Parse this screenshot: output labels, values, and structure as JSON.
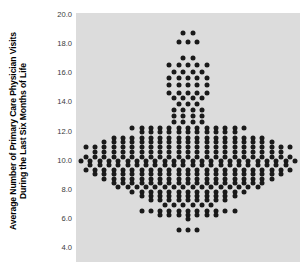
{
  "chart_data": {
    "type": "scatter",
    "plot_style": "dot-plot",
    "title": "",
    "xlabel": "",
    "ylabel": "Average Number of Primary Care Physician Visits During the Last Six Months of Life",
    "ylabel_line1": "Average Number of Primary Care Physician Visits",
    "ylabel_line2": "During the Last Six Months of Life",
    "ylim": [
      4.0,
      20.0
    ],
    "ytick_labels": [
      "20.0",
      "18.0",
      "16.0",
      "14.0",
      "12.0",
      "10.0",
      "8.0",
      "6.0",
      "4.0"
    ],
    "ytick_values": [
      20.0,
      18.0,
      16.0,
      14.0,
      12.0,
      10.0,
      8.0,
      6.0,
      4.0
    ],
    "xlim": [
      0,
      1
    ],
    "xtick_labels": [],
    "grid": false,
    "legend": false,
    "panel_background": "#dcdcdc",
    "dot_color": "#1a1a1a",
    "dot_diameter_px": 5,
    "dot_spacing_px": 9.3,
    "n_points": 496,
    "rows": [
      {
        "value": 18.7,
        "count": 2
      },
      {
        "value": 18.1,
        "count": 3
      },
      {
        "value": 17.0,
        "count": 2
      },
      {
        "value": 16.5,
        "count": 5
      },
      {
        "value": 16.0,
        "count": 4
      },
      {
        "value": 15.6,
        "count": 5
      },
      {
        "value": 15.1,
        "count": 5
      },
      {
        "value": 14.6,
        "count": 5
      },
      {
        "value": 14.2,
        "count": 4
      },
      {
        "value": 13.8,
        "count": 3
      },
      {
        "value": 13.4,
        "count": 4
      },
      {
        "value": 13.0,
        "count": 4
      },
      {
        "value": 12.6,
        "count": 4
      },
      {
        "value": 12.2,
        "count": 13
      },
      {
        "value": 11.9,
        "count": 11
      },
      {
        "value": 11.5,
        "count": 17
      },
      {
        "value": 11.2,
        "count": 19
      },
      {
        "value": 10.9,
        "count": 23
      },
      {
        "value": 10.5,
        "count": 21
      },
      {
        "value": 10.2,
        "count": 23
      },
      {
        "value": 9.9,
        "count": 24
      },
      {
        "value": 9.6,
        "count": 22
      },
      {
        "value": 9.3,
        "count": 23
      },
      {
        "value": 9.0,
        "count": 21
      },
      {
        "value": 8.7,
        "count": 19
      },
      {
        "value": 8.4,
        "count": 17
      },
      {
        "value": 8.1,
        "count": 16
      },
      {
        "value": 7.8,
        "count": 13
      },
      {
        "value": 7.5,
        "count": 11
      },
      {
        "value": 7.2,
        "count": 9
      },
      {
        "value": 6.9,
        "count": 6
      },
      {
        "value": 6.5,
        "count": 11
      },
      {
        "value": 6.2,
        "count": 7
      },
      {
        "value": 5.9,
        "count": 1
      },
      {
        "value": 5.2,
        "count": 3
      }
    ]
  }
}
